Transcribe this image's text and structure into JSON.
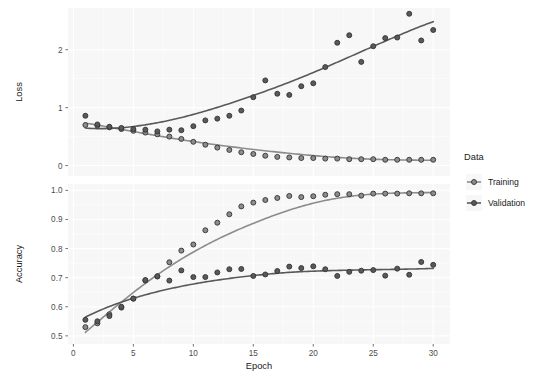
{
  "chart_data": {
    "type": "scatter",
    "title": "",
    "xlabel": "Epoch",
    "facets": [
      {
        "name": "loss",
        "ylabel": "Loss",
        "ylim": [
          -0.18,
          2.72
        ],
        "yticks": [
          0,
          1,
          2
        ],
        "yticklabels": [
          "0",
          "1",
          "2"
        ],
        "series": [
          {
            "name": "Training",
            "color": "#8c8c8c",
            "x": [
              1,
              2,
              3,
              4,
              5,
              6,
              7,
              8,
              9,
              10,
              11,
              12,
              13,
              14,
              15,
              16,
              17,
              18,
              19,
              20,
              21,
              22,
              23,
              24,
              25,
              26,
              27,
              28,
              29,
              30
            ],
            "values": [
              0.7,
              0.69,
              0.66,
              0.63,
              0.6,
              0.57,
              0.54,
              0.5,
              0.46,
              0.41,
              0.36,
              0.31,
              0.27,
              0.23,
              0.2,
              0.17,
              0.15,
              0.14,
              0.13,
              0.13,
              0.12,
              0.12,
              0.11,
              0.11,
              0.11,
              0.1,
              0.1,
              0.1,
              0.1,
              0.1
            ]
          },
          {
            "name": "Validation",
            "color": "#595959",
            "x": [
              1,
              2,
              3,
              4,
              5,
              6,
              7,
              8,
              9,
              10,
              11,
              12,
              13,
              14,
              15,
              16,
              17,
              18,
              19,
              20,
              21,
              22,
              23,
              24,
              25,
              26,
              27,
              28,
              29,
              30
            ],
            "values": [
              0.86,
              0.71,
              0.67,
              0.65,
              0.63,
              0.62,
              0.59,
              0.62,
              0.61,
              0.68,
              0.78,
              0.81,
              0.86,
              0.95,
              1.18,
              1.47,
              1.24,
              1.22,
              1.37,
              1.42,
              1.7,
              2.12,
              2.25,
              1.79,
              2.06,
              2.2,
              2.21,
              2.62,
              2.16,
              2.34
            ]
          }
        ]
      },
      {
        "name": "accuracy",
        "ylabel": "Accuracy",
        "ylim": [
          0.472,
          1.022
        ],
        "yticks": [
          0.5,
          0.6,
          0.7,
          0.8,
          0.9,
          1.0
        ],
        "yticklabels": [
          "0.5",
          "0.6",
          "0.7",
          "0.8",
          "0.9",
          "1.0"
        ],
        "series": [
          {
            "name": "Training",
            "color": "#8c8c8c",
            "x": [
              1,
              2,
              3,
              4,
              5,
              6,
              7,
              8,
              9,
              10,
              11,
              12,
              13,
              14,
              15,
              16,
              17,
              18,
              19,
              20,
              21,
              22,
              23,
              24,
              25,
              26,
              27,
              28,
              29,
              30
            ],
            "values": [
              0.53,
              0.543,
              0.574,
              0.597,
              0.628,
              0.69,
              0.704,
              0.753,
              0.793,
              0.814,
              0.863,
              0.889,
              0.918,
              0.945,
              0.958,
              0.967,
              0.974,
              0.981,
              0.977,
              0.98,
              0.985,
              0.987,
              0.987,
              0.982,
              0.989,
              0.989,
              0.989,
              0.99,
              0.99,
              0.99
            ]
          },
          {
            "name": "Validation",
            "color": "#595959",
            "x": [
              1,
              2,
              3,
              4,
              5,
              6,
              7,
              8,
              9,
              10,
              11,
              12,
              13,
              14,
              15,
              16,
              17,
              18,
              19,
              20,
              21,
              22,
              23,
              24,
              25,
              26,
              27,
              28,
              29,
              30
            ],
            "values": [
              0.555,
              0.55,
              0.568,
              0.6,
              0.628,
              0.692,
              0.705,
              0.69,
              0.725,
              0.702,
              0.702,
              0.718,
              0.729,
              0.73,
              0.706,
              0.711,
              0.723,
              0.738,
              0.733,
              0.739,
              0.729,
              0.706,
              0.72,
              0.724,
              0.726,
              0.707,
              0.731,
              0.71,
              0.754,
              0.744
            ]
          }
        ]
      }
    ],
    "xticks": [
      0,
      5,
      10,
      15,
      20,
      25,
      30
    ],
    "xticklabels": [
      "0",
      "5",
      "10",
      "15",
      "20",
      "25",
      "30"
    ],
    "xlim": [
      -0.45,
      31.4
    ],
    "grid": true,
    "legend": {
      "title": "Data",
      "position": "right",
      "entries": [
        {
          "label": "Training",
          "color": "#8c8c8c"
        },
        {
          "label": "Validation",
          "color": "#595959"
        }
      ]
    },
    "style": {
      "panel_bg": "#f7f7f7",
      "grid_color": "#ffffff",
      "text_color": "#1a1a1a",
      "tick_color": "#4d4d4d",
      "point_stroke": "#333333"
    }
  }
}
